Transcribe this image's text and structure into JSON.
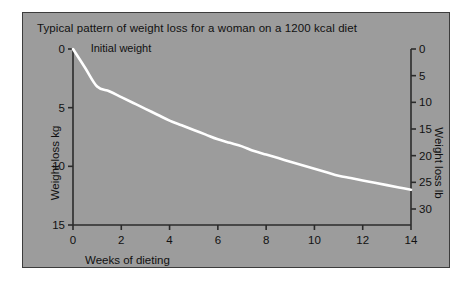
{
  "figure": {
    "background_color": "#ffffff",
    "panel_color": "#9c9c9c",
    "panel_border_color": "#3c3c3c",
    "axis_color": "#2b2b2b",
    "curve_color": "#ffffff",
    "text_color": "#111111"
  },
  "chart_data": {
    "type": "line",
    "title": "Typical pattern of weight loss for a woman on a 1200 kcal diet",
    "xlabel": "Weeks of dieting",
    "ylabel": "Weight loss kg",
    "ylabel_secondary": "Weight loss lb",
    "xlim": [
      0,
      14
    ],
    "ylim": [
      0,
      15
    ],
    "ylim_secondary": [
      0,
      33
    ],
    "y_inverted": true,
    "grid": false,
    "legend": "none",
    "xticks": [
      0,
      2,
      4,
      6,
      8,
      10,
      12,
      14
    ],
    "xticklabels": [
      "0",
      "2",
      "4",
      "6",
      "8",
      "10",
      "12",
      "14"
    ],
    "yticks": [
      0,
      5,
      10,
      15
    ],
    "yticklabels": [
      "0",
      "5",
      "10",
      "15"
    ],
    "yticks_secondary": [
      0,
      5,
      10,
      15,
      20,
      25,
      30
    ],
    "yticklabels_secondary": [
      "0",
      "5",
      "10",
      "15",
      "20",
      "25",
      "30"
    ],
    "annotations": [
      {
        "text": "Initial weight",
        "x": 0.4,
        "y": 0.0
      }
    ],
    "series": [
      {
        "name": "Weight loss",
        "x": [
          0,
          0.5,
          1.0,
          1.5,
          2.0,
          2.5,
          3.0,
          3.5,
          4.0,
          4.5,
          5.0,
          5.5,
          6.0,
          6.5,
          7.0,
          7.5,
          8.0,
          8.5,
          9.0,
          9.5,
          10.0,
          10.5,
          11.0,
          11.5,
          12.0,
          12.5,
          13.0,
          13.5,
          14.0
        ],
        "values": [
          0.0,
          1.6,
          3.2,
          3.6,
          4.1,
          4.6,
          5.1,
          5.6,
          6.1,
          6.5,
          6.9,
          7.3,
          7.7,
          8.0,
          8.3,
          8.7,
          9.0,
          9.3,
          9.6,
          9.9,
          10.2,
          10.5,
          10.8,
          11.0,
          11.2,
          11.4,
          11.6,
          11.8,
          12.0
        ],
        "unit": "kg"
      }
    ]
  }
}
